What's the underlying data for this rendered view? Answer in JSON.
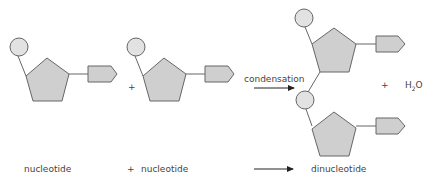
{
  "diagram": {
    "labels": {
      "nucleotide_1": "nucleotide",
      "plus_bottom": "+",
      "nucleotide_2": "nucleotide",
      "dinucleotide": "dinucleotide",
      "condensation": "condensation",
      "plus_middle": "+",
      "plus_right": "+",
      "water_h": "H",
      "water_sub": "2",
      "water_o": "O"
    },
    "colors": {
      "shape_fill": "#cfcfcf",
      "phosphate_fill": "#e2e2e2",
      "stroke": "#666666",
      "text": "#444444",
      "arrow": "#222222"
    }
  }
}
